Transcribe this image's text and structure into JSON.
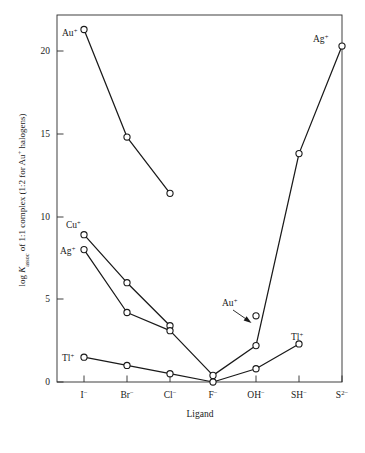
{
  "chart_data": {
    "type": "line",
    "title": "",
    "xlabel": "Ligand",
    "ylabel": "log Kassoc of 1:1 complex (1:2 for Au+ halogens)",
    "ylabel_parts": {
      "prefix": "log ",
      "italic_symbol": "K",
      "subscript": "assoc",
      "suffix": " of 1:1 complex (1:2 for Au",
      "sup": "+",
      "tail": " halogens)"
    },
    "categories": [
      "I⁻",
      "Br⁻",
      "Cl⁻",
      "F⁻",
      "OH⁻",
      "SH⁻",
      "S²⁻"
    ],
    "category_parts": [
      {
        "base": "I",
        "sup": "−"
      },
      {
        "base": "Br",
        "sup": "−"
      },
      {
        "base": "Cl",
        "sup": "−"
      },
      {
        "base": "F",
        "sup": "−"
      },
      {
        "base": "OH",
        "sup": "−"
      },
      {
        "base": "SH",
        "sup": "−"
      },
      {
        "base": "S",
        "sup": "2−"
      }
    ],
    "yticks": [
      0,
      5,
      10,
      15,
      20
    ],
    "ytick_labels": [
      "0",
      "5",
      "10",
      "15",
      "20"
    ],
    "ylim": [
      -1.2,
      22.2
    ],
    "grid": false,
    "legend_position": "inline-labels",
    "series": [
      {
        "name": "Au+",
        "label_base": "Au",
        "label_sup": "+",
        "points": [
          {
            "x": "I⁻",
            "y": 21.3
          },
          {
            "x": "Br⁻",
            "y": 14.8
          },
          {
            "x": "Cl⁻",
            "y": 11.4
          }
        ]
      },
      {
        "name": "Cu+",
        "label_base": "Cu",
        "label_sup": "+",
        "points": [
          {
            "x": "I⁻",
            "y": 8.9
          },
          {
            "x": "Br⁻",
            "y": 6.0
          },
          {
            "x": "Cl⁻",
            "y": 3.4
          }
        ]
      },
      {
        "name": "Ag+",
        "label_base": "Ag",
        "label_sup": "+",
        "points": [
          {
            "x": "I⁻",
            "y": 8.0
          },
          {
            "x": "Br⁻",
            "y": 4.2
          },
          {
            "x": "Cl⁻",
            "y": 3.1
          },
          {
            "x": "F⁻",
            "y": 0.4
          },
          {
            "x": "OH⁻",
            "y": 2.2
          },
          {
            "x": "SH⁻",
            "y": 13.8
          },
          {
            "x": "S²⁻",
            "y": 20.3
          }
        ]
      },
      {
        "name": "Tl+",
        "label_base": "Tl",
        "label_sup": "+",
        "points": [
          {
            "x": "I⁻",
            "y": 1.5
          },
          {
            "x": "Br⁻",
            "y": 1.0
          },
          {
            "x": "Cl⁻",
            "y": 0.5
          },
          {
            "x": "F⁻",
            "y": 0.0
          },
          {
            "x": "OH⁻",
            "y": 0.8
          },
          {
            "x": "SH⁻",
            "y": 2.3
          }
        ]
      },
      {
        "name": "Au+ hydroxide",
        "label_base": "Au",
        "label_sup": "+",
        "annotated": true,
        "points": [
          {
            "x": "OH⁻",
            "y": 4.0
          }
        ]
      }
    ],
    "annotations": [
      {
        "name": "au-oh-arrow",
        "text_base": "Au",
        "text_sup": "+",
        "target_x": "OH⁻",
        "target_y": 4.0
      }
    ],
    "series_inline_labels": [
      {
        "name": "Au+",
        "base": "Au",
        "sup": "+",
        "anchor_x": "I⁻",
        "anchor_y": 21.3,
        "side": "left-below"
      },
      {
        "name": "Ag+ right",
        "base": "Ag",
        "sup": "+",
        "anchor_x": "S²⁻",
        "anchor_y": 20.3,
        "side": "left"
      },
      {
        "name": "Cu+",
        "base": "Cu",
        "sup": "+",
        "anchor_x": "I⁻",
        "anchor_y": 8.9,
        "side": "above-left"
      },
      {
        "name": "Ag+ left",
        "base": "Ag",
        "sup": "+",
        "anchor_x": "I⁻",
        "anchor_y": 8.0,
        "side": "left"
      },
      {
        "name": "Tl+ left",
        "base": "Tl",
        "sup": "+",
        "anchor_x": "I⁻",
        "anchor_y": 1.5,
        "side": "left"
      },
      {
        "name": "Tl+ right",
        "base": "Tl",
        "sup": "+",
        "anchor_x": "SH⁻",
        "anchor_y": 2.3,
        "side": "above"
      }
    ]
  },
  "colors": {
    "ink": "#1a1a1a",
    "axis": "#2b2b2b",
    "background": "#ffffff",
    "marker_fill": "#ffffff"
  }
}
